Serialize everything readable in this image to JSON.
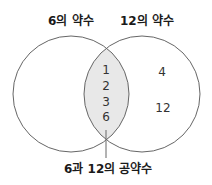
{
  "title_left": "6의 약수",
  "title_right": "12의 약수",
  "intersection_values": [
    "1",
    "2",
    "3",
    "6"
  ],
  "right_only_values": [
    "4",
    "12"
  ],
  "left_only_values": [],
  "callout_label": "6과 12의 공약수",
  "colors": {
    "stroke": "#666666",
    "intersection_fill": "#e8e8e8"
  }
}
